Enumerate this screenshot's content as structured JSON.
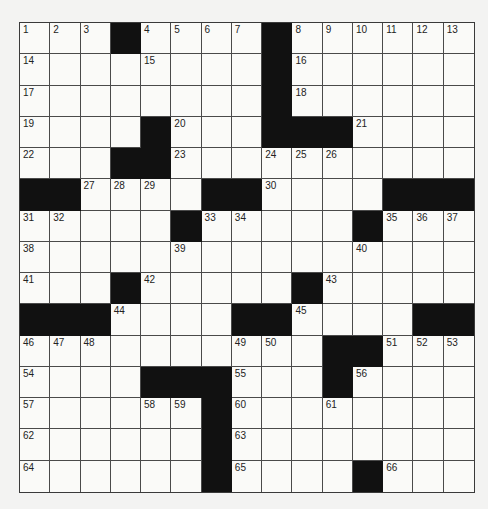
{
  "puzzle": {
    "type": "crossword",
    "size": {
      "rows": 15,
      "cols": 15
    },
    "colors": {
      "black": "#111111",
      "white": "#fafaf8",
      "line": "#4a4a4a",
      "background": "#f3f3f2"
    },
    "black_cells": [
      [
        0,
        3
      ],
      [
        0,
        8
      ],
      [
        1,
        8
      ],
      [
        2,
        8
      ],
      [
        3,
        4
      ],
      [
        3,
        8
      ],
      [
        3,
        9
      ],
      [
        3,
        10
      ],
      [
        4,
        3
      ],
      [
        4,
        4
      ],
      [
        5,
        0
      ],
      [
        5,
        1
      ],
      [
        5,
        6
      ],
      [
        5,
        7
      ],
      [
        5,
        12
      ],
      [
        5,
        13
      ],
      [
        5,
        14
      ],
      [
        6,
        5
      ],
      [
        6,
        11
      ],
      [
        8,
        3
      ],
      [
        8,
        9
      ],
      [
        9,
        0
      ],
      [
        9,
        1
      ],
      [
        9,
        2
      ],
      [
        9,
        7
      ],
      [
        9,
        8
      ],
      [
        9,
        13
      ],
      [
        9,
        14
      ],
      [
        10,
        10
      ],
      [
        10,
        11
      ],
      [
        11,
        4
      ],
      [
        11,
        5
      ],
      [
        11,
        6
      ],
      [
        11,
        10
      ],
      [
        12,
        6
      ],
      [
        13,
        6
      ],
      [
        14,
        6
      ],
      [
        14,
        11
      ]
    ],
    "numbers": {
      "0,0": "1",
      "0,1": "2",
      "0,2": "3",
      "0,4": "4",
      "0,5": "5",
      "0,6": "6",
      "0,7": "7",
      "0,9": "8",
      "0,10": "9",
      "0,11": "10",
      "0,12": "11",
      "0,13": "12",
      "0,14": "13",
      "1,0": "14",
      "1,4": "15",
      "1,9": "16",
      "2,0": "17",
      "2,9": "18",
      "3,0": "19",
      "3,5": "20",
      "3,11": "21",
      "4,0": "22",
      "4,5": "23",
      "4,8": "24",
      "4,9": "25",
      "4,10": "26",
      "5,2": "27",
      "5,3": "28",
      "5,4": "29",
      "5,8": "30",
      "6,0": "31",
      "6,1": "32",
      "6,6": "33",
      "6,7": "34",
      "6,12": "35",
      "6,13": "36",
      "6,14": "37",
      "7,0": "38",
      "7,5": "39",
      "7,11": "40",
      "8,0": "41",
      "8,4": "42",
      "8,10": "43",
      "9,3": "44",
      "9,9": "45",
      "10,0": "46",
      "10,1": "47",
      "10,2": "48",
      "10,7": "49",
      "10,8": "50",
      "10,12": "51",
      "10,13": "52",
      "10,14": "53",
      "11,0": "54",
      "11,7": "55",
      "11,11": "56",
      "12,0": "57",
      "12,4": "58",
      "12,5": "59",
      "12,7": "60",
      "12,10": "61",
      "13,0": "62",
      "13,7": "63",
      "14,0": "64",
      "14,7": "65",
      "14,12": "66"
    }
  }
}
